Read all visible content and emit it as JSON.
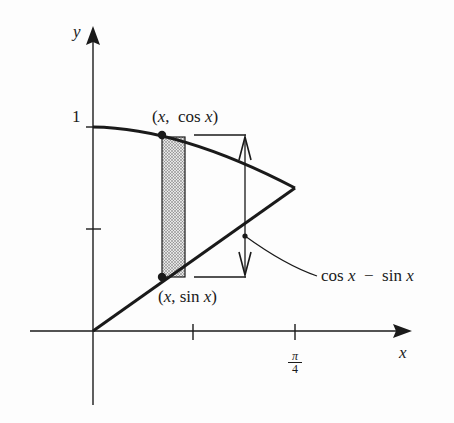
{
  "diagram": {
    "axes": {
      "x_label": "x",
      "y_label": "y",
      "y_tick_label": "1",
      "x_tick_label_num": "π",
      "x_tick_label_den": "4"
    },
    "curves": [
      {
        "name": "cos x",
        "description": "upper curve, from (0,1) to (π/4, √2/2)"
      },
      {
        "name": "sin x",
        "description": "lower curve, from (0,0) to (π/4, √2/2)"
      }
    ],
    "labels": {
      "upper_point": "(x,  cos x)",
      "lower_point": "(x, sin x)",
      "difference": "cos x  −  sin x"
    },
    "strip": {
      "description": "shaded representative rectangle of width Δx between the curves"
    },
    "colors": {
      "ink": "#1a1a1a",
      "strip_fill": "#c8c8c8",
      "background": "#fdfdfd"
    }
  }
}
